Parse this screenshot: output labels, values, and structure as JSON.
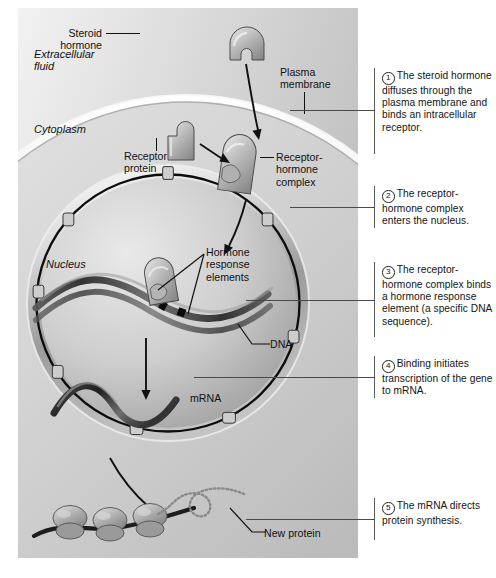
{
  "figure": {
    "type": "biological-process-diagram",
    "palette": {
      "background": "#ffffff",
      "panel_light": "#efefef",
      "panel_mid": "#c9c9c9",
      "panel_dark": "#8f8f8f",
      "outline": "#141414",
      "text": "#141414"
    }
  },
  "region_labels": {
    "extracellular_fluid": "Extracellular\nfluid",
    "extracellular_fluid_line1": "Extracellular",
    "extracellular_fluid_line2": "fluid",
    "cytoplasm": "Cytoplasm",
    "nucleus": "Nucleus"
  },
  "structure_labels": {
    "steroid_hormone_l1": "Steroid",
    "steroid_hormone_l2": "hormone",
    "plasma_membrane_l1": "Plasma",
    "plasma_membrane_l2": "membrane",
    "receptor_protein_l1": "Receptor",
    "receptor_protein_l2": "protein",
    "receptor_hormone_complex_l1": "Receptor-",
    "receptor_hormone_complex_l2": "hormone",
    "receptor_hormone_complex_l3": "complex",
    "hormone_response_elements_l1": "Hormone",
    "hormone_response_elements_l2": "response",
    "hormone_response_elements_l3": "elements",
    "dna": "DNA",
    "mrna": "mRNA",
    "new_protein": "New protein"
  },
  "steps": [
    {
      "number": "1",
      "text": "The steroid hormone diffuses through the plasma membrane and binds an intracellular receptor."
    },
    {
      "number": "2",
      "text": "The receptor-hormone complex enters the nucleus."
    },
    {
      "number": "3",
      "text": "The receptor-hormone complex binds a hormone response element (a specific DNA sequence)."
    },
    {
      "number": "4",
      "text": "Binding initiates transcription of the gene to mRNA."
    },
    {
      "number": "5",
      "text": "The mRNA directs protein synthesis."
    }
  ]
}
